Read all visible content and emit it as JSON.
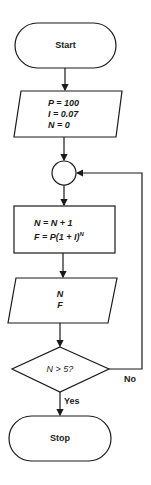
{
  "diagram": {
    "type": "flowchart",
    "nodes": {
      "start": {
        "shape": "terminal",
        "label": "Start"
      },
      "input": {
        "shape": "parallelogram",
        "lines": [
          "P = 100",
          "I = 0.07",
          "N = 0"
        ]
      },
      "connector": {
        "shape": "circle",
        "label": ""
      },
      "process": {
        "shape": "rectangle",
        "lines": [
          "N = N + 1",
          "F = P(1 + I)",
          "N"
        ]
      },
      "output": {
        "shape": "parallelogram",
        "lines": [
          "N",
          "F"
        ]
      },
      "decision": {
        "shape": "diamond",
        "label": "N > 5?"
      },
      "stop": {
        "shape": "terminal",
        "label": "Stop"
      }
    },
    "edges": {
      "yes_label": "Yes",
      "no_label": "No"
    },
    "colors": {
      "stroke": "#1a1a1a",
      "background": "#ffffff"
    }
  }
}
